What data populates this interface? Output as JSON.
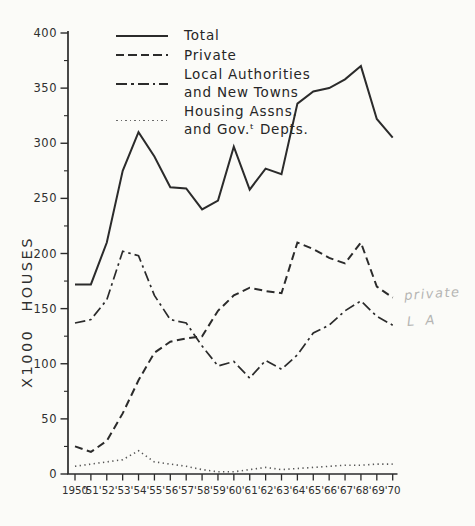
{
  "colors": {
    "ink": "#2b2b2b",
    "dotted_line": "#555555",
    "pencil": "#b5b5b3",
    "paper": "#fbfbf8"
  },
  "y_axis": {
    "title": "X1000 HOUSES",
    "tick_labels": [
      "0",
      "50",
      "100",
      "150",
      "200",
      "250",
      "300",
      "350",
      "400"
    ]
  },
  "legend": {
    "items": [
      {
        "label": "Total",
        "style": "solid"
      },
      {
        "label": "Private",
        "style": "dashed"
      },
      {
        "label": "Local Authorities\nand New Towns",
        "style": "dashdot"
      },
      {
        "label": "Housing Assns.\nand Gov.ᵗ Depts.",
        "style": "dotted"
      }
    ]
  },
  "chart_data": {
    "type": "line",
    "title": "",
    "xlabel": "",
    "ylabel": "X1000 HOUSES",
    "ylim": [
      0,
      400
    ],
    "y_major_step": 50,
    "y_minor_step": 25,
    "grid": false,
    "legend_position": "top-center-inside",
    "categories": [
      "1950",
      "'51",
      "'52",
      "'53",
      "'54",
      "'55",
      "'56",
      "'57",
      "'58",
      "'59",
      "'60",
      "'61",
      "'62",
      "'63",
      "'64",
      "'65",
      "'66",
      "'67",
      "'68",
      "'69",
      "'70"
    ],
    "series": [
      {
        "name": "Total",
        "style": "solid",
        "values": [
          172,
          172,
          210,
          275,
          310,
          288,
          260,
          259,
          240,
          248,
          297,
          258,
          277,
          272,
          336,
          347,
          350,
          358,
          370,
          322,
          305
        ]
      },
      {
        "name": "Private",
        "style": "dashed",
        "values": [
          25,
          20,
          30,
          55,
          85,
          110,
          120,
          123,
          125,
          148,
          162,
          169,
          166,
          164,
          210,
          204,
          196,
          191,
          210,
          170,
          160
        ]
      },
      {
        "name": "Local Authorities and New Towns",
        "style": "dashdot",
        "values": [
          137,
          140,
          158,
          202,
          198,
          162,
          140,
          137,
          116,
          98,
          102,
          87,
          103,
          95,
          108,
          128,
          135,
          148,
          157,
          143,
          135
        ]
      },
      {
        "name": "Housing Assns. and Govt Depts.",
        "style": "dotted",
        "values": [
          7,
          9,
          11,
          13,
          21,
          11,
          9,
          7,
          4,
          2,
          2,
          4,
          6,
          4,
          5,
          6,
          7,
          8,
          8,
          9,
          9
        ]
      }
    ],
    "annotations": [
      {
        "text": "private",
        "kind": "handwritten-pencil",
        "target_series": "Private"
      },
      {
        "text": "L A",
        "kind": "handwritten-pencil",
        "target_series": "Local Authorities and New Towns"
      }
    ]
  }
}
